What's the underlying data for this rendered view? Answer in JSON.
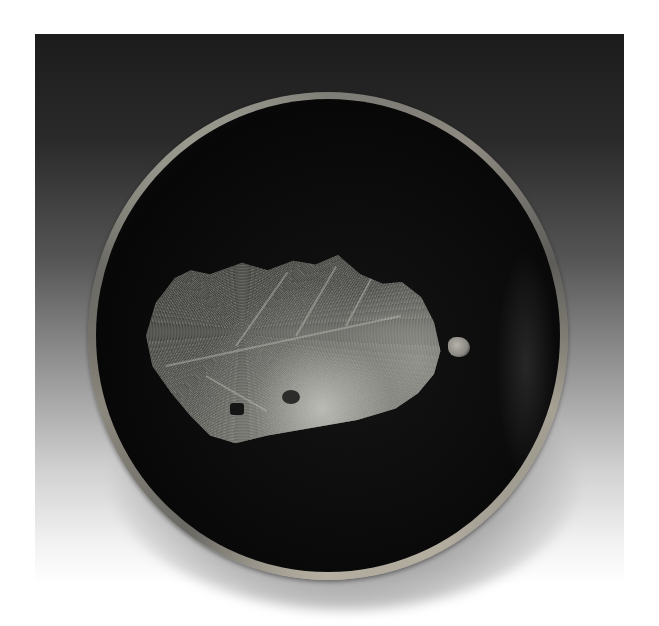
{
  "image": {
    "subject": "Dark glazed tea bowl with leaf pattern, viewed from above",
    "elements": {
      "background": "gradient backdrop, dark gray at top fading to white at bottom",
      "bowl": "round black-glazed bowl with mottled tan rim",
      "leaf": "speckled light-gray leaf impression across interior"
    },
    "colors": {
      "backdrop_top": "#1c1c1c",
      "backdrop_bottom": "#ffffff",
      "bowl_interior": "#0c0c0c",
      "rim": "#8f8b82",
      "leaf": "#7c7b75"
    }
  }
}
